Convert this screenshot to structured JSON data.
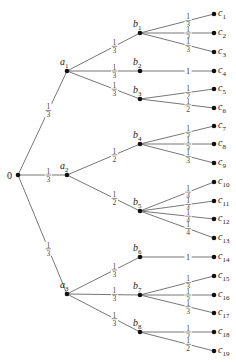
{
  "diagram": {
    "type": "probability-tree",
    "root": {
      "id": "root",
      "label": "0",
      "x": 18,
      "y": 175
    },
    "nodes": [
      {
        "id": "a1",
        "label": "a",
        "sub": "1",
        "x": 67,
        "y": 71
      },
      {
        "id": "a2",
        "label": "a",
        "sub": "2",
        "x": 67,
        "y": 175
      },
      {
        "id": "a3",
        "label": "a",
        "sub": "3",
        "x": 67,
        "y": 294
      },
      {
        "id": "b1",
        "label": "b",
        "sub": "1",
        "x": 140,
        "y": 33
      },
      {
        "id": "b2",
        "label": "b",
        "sub": "2",
        "x": 140,
        "y": 71
      },
      {
        "id": "b3",
        "label": "b",
        "sub": "3",
        "x": 140,
        "y": 99
      },
      {
        "id": "b4",
        "label": "b",
        "sub": "4",
        "x": 140,
        "y": 144
      },
      {
        "id": "b5",
        "label": "b",
        "sub": "5",
        "x": 140,
        "y": 211
      },
      {
        "id": "b6",
        "label": "b",
        "sub": "6",
        "x": 140,
        "y": 257
      },
      {
        "id": "b7",
        "label": "b",
        "sub": "7",
        "x": 140,
        "y": 295
      },
      {
        "id": "b8",
        "label": "b",
        "sub": "8",
        "x": 140,
        "y": 332
      },
      {
        "id": "c1",
        "label": "c",
        "sub": "1",
        "x": 214,
        "y": 14
      },
      {
        "id": "c2",
        "label": "c",
        "sub": "2",
        "x": 214,
        "y": 33
      },
      {
        "id": "c3",
        "label": "c",
        "sub": "3",
        "x": 214,
        "y": 52
      },
      {
        "id": "c4",
        "label": "c",
        "sub": "4",
        "x": 214,
        "y": 71
      },
      {
        "id": "c5",
        "label": "c",
        "sub": "5",
        "x": 214,
        "y": 89
      },
      {
        "id": "c6",
        "label": "c",
        "sub": "6",
        "x": 214,
        "y": 108
      },
      {
        "id": "c7",
        "label": "c",
        "sub": "7",
        "x": 214,
        "y": 126
      },
      {
        "id": "c8",
        "label": "c",
        "sub": "8",
        "x": 214,
        "y": 144
      },
      {
        "id": "c9",
        "label": "c",
        "sub": "9",
        "x": 214,
        "y": 163
      },
      {
        "id": "c10",
        "label": "c",
        "sub": "10",
        "x": 214,
        "y": 182
      },
      {
        "id": "c11",
        "label": "c",
        "sub": "11",
        "x": 214,
        "y": 201
      },
      {
        "id": "c12",
        "label": "c",
        "sub": "12",
        "x": 214,
        "y": 219
      },
      {
        "id": "c13",
        "label": "c",
        "sub": "13",
        "x": 214,
        "y": 238
      },
      {
        "id": "c14",
        "label": "c",
        "sub": "14",
        "x": 214,
        "y": 257
      },
      {
        "id": "c15",
        "label": "c",
        "sub": "15",
        "x": 214,
        "y": 276
      },
      {
        "id": "c16",
        "label": "c",
        "sub": "16",
        "x": 214,
        "y": 295
      },
      {
        "id": "c17",
        "label": "c",
        "sub": "17",
        "x": 214,
        "y": 313
      },
      {
        "id": "c18",
        "label": "c",
        "sub": "18",
        "x": 214,
        "y": 332
      },
      {
        "id": "c19",
        "label": "c",
        "sub": "19",
        "x": 214,
        "y": 351
      }
    ],
    "edges": [
      {
        "from": "root",
        "to": "a1",
        "prob": "1/3"
      },
      {
        "from": "root",
        "to": "a2",
        "prob": "1/3"
      },
      {
        "from": "root",
        "to": "a3",
        "prob": "1/3"
      },
      {
        "from": "a1",
        "to": "b1",
        "prob": "1/3"
      },
      {
        "from": "a1",
        "to": "b2",
        "prob": "1/3"
      },
      {
        "from": "a1",
        "to": "b3",
        "prob": "1/3"
      },
      {
        "from": "a2",
        "to": "b4",
        "prob": "1/2"
      },
      {
        "from": "a2",
        "to": "b5",
        "prob": "1/2"
      },
      {
        "from": "a3",
        "to": "b6",
        "prob": "1/3"
      },
      {
        "from": "a3",
        "to": "b7",
        "prob": "1/3"
      },
      {
        "from": "a3",
        "to": "b8",
        "prob": "1/3"
      },
      {
        "from": "b1",
        "to": "c1",
        "prob": "1/3"
      },
      {
        "from": "b1",
        "to": "c2",
        "prob": "1/3"
      },
      {
        "from": "b1",
        "to": "c3",
        "prob": "1/3"
      },
      {
        "from": "b2",
        "to": "c4",
        "prob": "1"
      },
      {
        "from": "b3",
        "to": "c5",
        "prob": "1/2"
      },
      {
        "from": "b3",
        "to": "c6",
        "prob": "1/2"
      },
      {
        "from": "b4",
        "to": "c7",
        "prob": "1/3"
      },
      {
        "from": "b4",
        "to": "c8",
        "prob": "1/3"
      },
      {
        "from": "b4",
        "to": "c9",
        "prob": "1/3"
      },
      {
        "from": "b5",
        "to": "c10",
        "prob": "1/4"
      },
      {
        "from": "b5",
        "to": "c11",
        "prob": "1/4"
      },
      {
        "from": "b5",
        "to": "c12",
        "prob": "1/4"
      },
      {
        "from": "b5",
        "to": "c13",
        "prob": "1/4"
      },
      {
        "from": "b6",
        "to": "c14",
        "prob": "1"
      },
      {
        "from": "b7",
        "to": "c15",
        "prob": "1/3"
      },
      {
        "from": "b7",
        "to": "c16",
        "prob": "1/3"
      },
      {
        "from": "b7",
        "to": "c17",
        "prob": "1/3"
      },
      {
        "from": "b8",
        "to": "c18",
        "prob": "1/2"
      },
      {
        "from": "b8",
        "to": "c19",
        "prob": "1/2"
      }
    ]
  }
}
